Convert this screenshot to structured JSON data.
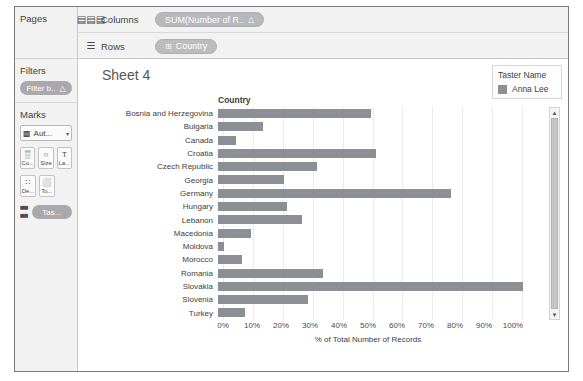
{
  "shelves": {
    "columns": {
      "label": "Columns",
      "icon": "columns-icon",
      "pill": "SUM(Number of R..",
      "pill_suffix": "△"
    },
    "rows": {
      "label": "Rows",
      "icon": "rows-icon",
      "pill": "Country",
      "pill_icon": "⊞"
    }
  },
  "rail": {
    "pages": {
      "title": "Pages"
    },
    "filters": {
      "title": "Filters",
      "pill": "Filter b..",
      "pill_suffix": "△"
    },
    "marks": {
      "title": "Marks",
      "type": "Aut...",
      "type_icon": "bar-icon",
      "caret": "▾",
      "buttons": [
        {
          "name": "color-button",
          "glyph": "▒",
          "cap": "Co..."
        },
        {
          "name": "size-button",
          "glyph": "○",
          "cap": "Size"
        },
        {
          "name": "label-button",
          "glyph": "T",
          "cap": "La..."
        },
        {
          "name": "detail-button",
          "glyph": "∷",
          "cap": "De..."
        },
        {
          "name": "tooltip-button",
          "glyph": "⬜",
          "cap": "To..."
        }
      ],
      "taster_pill": "Tas..."
    }
  },
  "worksheet": {
    "title": "Sheet 4",
    "field_header": "Country"
  },
  "legend": {
    "title": "Taster Name",
    "color": "#8d8f96",
    "items": [
      {
        "label": "Anna Lee",
        "color": "#8d8f96"
      }
    ]
  },
  "chart_data": {
    "type": "bar",
    "title": "Sheet 4",
    "xlabel": "% of Total Number of Records",
    "ylabel": "Country",
    "orientation": "horizontal",
    "grid": true,
    "legend_position": "right",
    "xlim": [
      0,
      105
    ],
    "xticks": [
      "0%",
      "10%",
      "20%",
      "30%",
      "40%",
      "50%",
      "60%",
      "70%",
      "80%",
      "90%",
      "100%"
    ],
    "xtick_values": [
      0,
      10,
      20,
      30,
      40,
      50,
      60,
      70,
      80,
      90,
      100
    ],
    "bar_color": "#8d8f96",
    "series_name": "Anna Lee",
    "categories": [
      "Bosnia and Herzegovina",
      "Bulgaria",
      "Canada",
      "Croatia",
      "Czech Republic",
      "Georgia",
      "Germany",
      "Hungary",
      "Lebanon",
      "Macedonia",
      "Moldova",
      "Morocco",
      "Romania",
      "Slovakia",
      "Slovenia",
      "Turkey"
    ],
    "values": [
      51,
      15,
      6,
      53,
      33,
      22,
      78,
      23,
      28,
      11,
      2,
      8,
      35,
      102,
      30,
      9
    ]
  }
}
